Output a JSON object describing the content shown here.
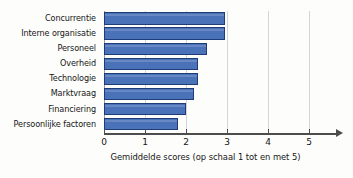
{
  "chart_data": {
    "type": "bar",
    "orientation": "horizontal",
    "title": "",
    "xlabel": "Gemiddelde scores (op schaal 1 tot en met 5)",
    "ylabel": "",
    "categories": [
      "Concurrentie",
      "Interne organisatie",
      "Personeel",
      "Overheid",
      "Technologie",
      "Marktvraag",
      "Financiering",
      "Persoonlijke factoren"
    ],
    "values": [
      2.95,
      2.95,
      2.5,
      2.3,
      2.3,
      2.2,
      2.0,
      1.8
    ],
    "xlim": [
      0,
      5.5
    ],
    "xticks": [
      0,
      1,
      2,
      3,
      4,
      5
    ],
    "xtick_labels": [
      "0",
      "1",
      "2",
      "3",
      "4",
      "5"
    ],
    "grid": "vertical",
    "legend": "none",
    "series": [
      {
        "name": "Gemiddelde score",
        "values": [
          2.95,
          2.95,
          2.5,
          2.3,
          2.3,
          2.2,
          2.0,
          1.8
        ]
      }
    ],
    "colors": {
      "bar_fill": "#4a72b8",
      "bar_border": "#1e3c78",
      "gridline": "#d4d4d4",
      "axis": "#4d4d4d",
      "text": "#151515",
      "background": "#fdfdfc"
    }
  }
}
